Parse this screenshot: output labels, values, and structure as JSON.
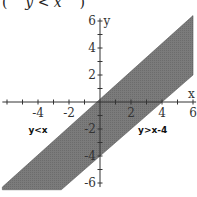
{
  "header": {
    "open_paren": "(",
    "expression": "y < x",
    "close_paren": ")"
  },
  "chart_data": {
    "type": "area",
    "title": "",
    "xlabel": "x",
    "ylabel": "y",
    "xlim": [
      -6.4,
      6.2
    ],
    "ylim": [
      -6.6,
      6.5
    ],
    "x_ticks": [
      -6,
      -5,
      -4,
      -3,
      -2,
      -1,
      0,
      1,
      2,
      3,
      4,
      5,
      6
    ],
    "x_tick_labels": [
      "-4",
      "-2",
      "2",
      "4",
      "6"
    ],
    "x_tick_label_values": [
      -4,
      -2,
      2,
      4,
      6
    ],
    "y_ticks": [
      -6,
      -5,
      -4,
      -3,
      -2,
      -1,
      0,
      1,
      2,
      3,
      4,
      5,
      6
    ],
    "y_tick_labels": [
      "6",
      "4",
      "2",
      "-2",
      "-4",
      "-6"
    ],
    "y_tick_label_values": [
      6,
      4,
      2,
      -2,
      -4,
      -6
    ],
    "grid": false,
    "series": [
      {
        "name": "y<x",
        "boundary": "y = x",
        "points": [
          [
            -6,
            -6
          ],
          [
            6,
            6
          ]
        ]
      },
      {
        "name": "y>x-4",
        "boundary": "y = x - 4",
        "points": [
          [
            -2.5,
            -6.5
          ],
          [
            6,
            2
          ]
        ]
      }
    ],
    "shaded_region": {
      "description": "x - 4 < y < x",
      "polygon": [
        [
          -6.3,
          -6.5
        ],
        [
          -6.3,
          -6.3
        ],
        [
          6,
          6.4
        ],
        [
          6,
          2
        ],
        [
          -2.5,
          -6.5
        ]
      ],
      "color": "#7a7a7a"
    },
    "annotations": [
      {
        "text": "y<x",
        "x": -4.0,
        "y": -2.0
      },
      {
        "text": "y>x-4",
        "x": 3.4,
        "y": -2.0
      }
    ]
  },
  "colors": {
    "band_fill": "#7b7b7b",
    "band_edge": "#5a5a5a",
    "axis": "#333333",
    "text": "#333333"
  }
}
